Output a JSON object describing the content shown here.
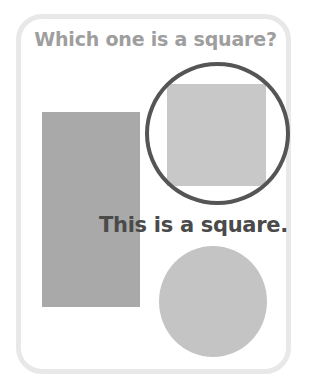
{
  "question": "Which one is a square?",
  "answer": "This is a square.",
  "shapes": [
    {
      "kind": "rectangle",
      "color": "#a9a9a9"
    },
    {
      "kind": "square",
      "color": "#c8c8c8",
      "highlighted": true
    },
    {
      "kind": "circle",
      "color": "#c4c4c4"
    }
  ],
  "highlight_ring_color": "#555555",
  "card_border_color": "#e8e8e8"
}
